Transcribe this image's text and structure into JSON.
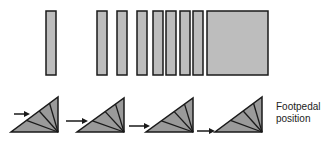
{
  "colors": {
    "fill": "#bdbdbd",
    "triangle_fill": "#9a9a9a",
    "stroke": "#1a1a1a",
    "background": "#ffffff"
  },
  "bars": [
    {
      "x": 46,
      "y": 11,
      "w": 10,
      "h": 64
    },
    {
      "x": 97,
      "y": 11,
      "w": 10,
      "h": 64
    },
    {
      "x": 117,
      "y": 11,
      "w": 10,
      "h": 64
    },
    {
      "x": 137,
      "y": 11,
      "w": 10,
      "h": 64
    },
    {
      "x": 153,
      "y": 11,
      "w": 10,
      "h": 64
    },
    {
      "x": 166,
      "y": 11,
      "w": 10,
      "h": 64
    },
    {
      "x": 180,
      "y": 11,
      "w": 10,
      "h": 64
    },
    {
      "x": 193,
      "y": 11,
      "w": 10,
      "h": 64
    },
    {
      "x": 207,
      "y": 11,
      "w": 61,
      "h": 64
    }
  ],
  "triangles": [
    {
      "base_left": 11,
      "base_right": 58,
      "top": 97,
      "bottom": 132,
      "arrow_y": 114,
      "arrow_from": 14,
      "arrow_to": 30
    },
    {
      "base_left": 77,
      "base_right": 124,
      "top": 98,
      "bottom": 132,
      "arrow_y": 121,
      "arrow_from": 66,
      "arrow_to": 88
    },
    {
      "base_left": 146,
      "base_right": 193,
      "top": 98,
      "bottom": 132,
      "arrow_y": 126,
      "arrow_from": 129,
      "arrow_to": 150
    },
    {
      "base_left": 215,
      "base_right": 262,
      "top": 97,
      "bottom": 132,
      "arrow_y": 131,
      "arrow_from": 197,
      "arrow_to": 215
    }
  ],
  "label": {
    "line1": "Footpedal",
    "line2": "position"
  }
}
